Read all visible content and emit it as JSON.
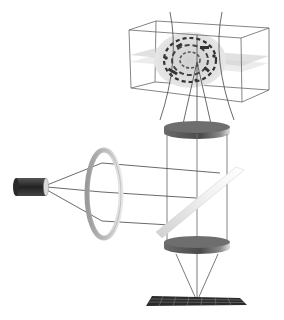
{
  "diagram": {
    "type": "optical-schematic",
    "components": [
      {
        "id": "light-source",
        "label": ""
      },
      {
        "id": "collimating-lens",
        "label": ""
      },
      {
        "id": "dichroic-mirror",
        "label": ""
      },
      {
        "id": "objective-lens",
        "label": ""
      },
      {
        "id": "specimen-volume",
        "label": ""
      },
      {
        "id": "tube-lens",
        "label": ""
      },
      {
        "id": "camera-sensor",
        "label": ""
      }
    ],
    "colors": {
      "background": "#ffffff",
      "line": "#555555",
      "lens_dark": "#5a5a5a",
      "lens_light": "#bdbdbd",
      "sensor": "#2b2b2b",
      "specimen_shell": "#d9d9d9",
      "light_sheet": "#c8c8c8"
    }
  }
}
